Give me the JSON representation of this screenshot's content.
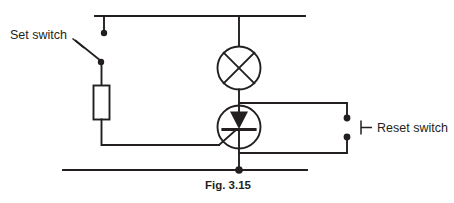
{
  "figure": {
    "caption": "Fig. 3.15",
    "background_color": "#ffffff",
    "ink_color": "#231f20"
  },
  "labels": {
    "set_switch": "Set switch",
    "reset_switch": "Reset switch"
  },
  "components": [
    {
      "id": "supply-rail-top",
      "name": "top-supply-rail",
      "type": "wire",
      "description": "Horizontal positive supply rail across the top"
    },
    {
      "id": "supply-rail-bottom",
      "name": "bottom-supply-rail",
      "type": "wire",
      "description": "Horizontal return rail across the bottom"
    },
    {
      "id": "set-switch",
      "name": "set-switch",
      "type": "push-to-make switch",
      "state": "open",
      "label": "Set switch"
    },
    {
      "id": "gate-resistor",
      "name": "gate-resistor",
      "type": "resistor",
      "orientation": "vertical"
    },
    {
      "id": "lamp",
      "name": "lamp",
      "type": "lamp",
      "symbol": "circle-with-cross"
    },
    {
      "id": "thyristor",
      "name": "thyristor",
      "type": "thyristor-scr",
      "symbol": "circle-with-triangle-and-bar"
    },
    {
      "id": "reset-switch",
      "name": "reset-switch",
      "type": "push-to-break switch",
      "state": "open",
      "label": "Reset switch"
    }
  ],
  "junctions": [
    {
      "name": "set-switch-top-terminal",
      "x": 104,
      "y": 33
    },
    {
      "name": "set-switch-bottom-terminal",
      "x": 101,
      "y": 62
    },
    {
      "name": "cathode-bottom-rail-junction",
      "x": 239,
      "y": 170
    },
    {
      "name": "reset-switch-upper-contact",
      "x": 347,
      "y": 118
    },
    {
      "name": "reset-switch-lower-contact",
      "x": 347,
      "y": 137
    }
  ]
}
